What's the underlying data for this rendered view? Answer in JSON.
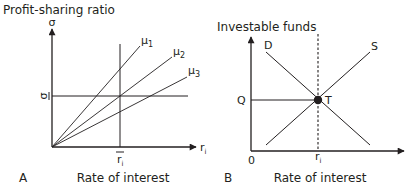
{
  "panel_a": {
    "panel_label": "A",
    "y_axis_title": "Profit-sharing ratio",
    "y_axis_symbol": "σ",
    "x_axis_symbol": "r",
    "x_axis_symbol_sub": "i",
    "x_axis_title": "Rate of interest",
    "sigma_bar_label": "σ",
    "ri_bar_label": "r",
    "ri_bar_sub": "i",
    "lines": [
      {
        "label": "μ",
        "sub": "1"
      },
      {
        "label": "μ",
        "sub": "2"
      },
      {
        "label": "μ",
        "sub": "3"
      }
    ]
  },
  "panel_b": {
    "panel_label": "B",
    "y_axis_title": "Investable funds",
    "x_axis_title": "Rate of interest",
    "origin_label": "0",
    "q_label": "Q",
    "equilibrium_label": "T",
    "ri_label": "r",
    "ri_sub": "i",
    "demand_label": "D",
    "supply_label": "S"
  },
  "colors": {
    "ink": "#231f20",
    "background": "#ffffff"
  }
}
